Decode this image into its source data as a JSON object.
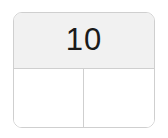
{
  "widget": {
    "name": "part-whole-box",
    "type": "number-bond-rectangle",
    "whole": {
      "label": "10",
      "filled": true
    },
    "parts": [
      {
        "label": "",
        "filled": false
      },
      {
        "label": "",
        "filled": false
      }
    ]
  },
  "colors": {
    "card_background": "#ffffff",
    "whole_cell_background": "#f1f1f1",
    "part_cell_background": "#ffffff",
    "border": "#cfcfcf",
    "text": "#1a1a1a",
    "page_background": "#ffffff"
  }
}
